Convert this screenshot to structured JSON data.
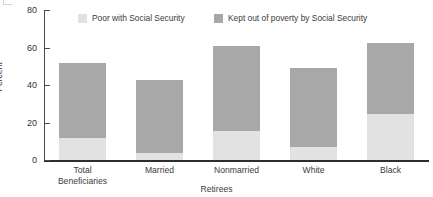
{
  "chart_data": {
    "type": "bar",
    "subtype": "stacked-bar",
    "title": "",
    "subtitle": "",
    "xlabel": "Retirees",
    "ylabel": "Percent",
    "categories": [
      "Total\nBeneficiaries",
      "Married",
      "Nonmarried",
      "White",
      "Black"
    ],
    "series": [
      {
        "name": "Poor with Social Security",
        "color": "#e2e2e2",
        "values": [
          11.5,
          3.7,
          15.5,
          7.0,
          24.5
        ]
      },
      {
        "name": "Kept out of poverty by Social Security",
        "color": "#a8a8a8",
        "values": [
          40.0,
          38.8,
          45.5,
          42.0,
          38.0
        ]
      }
    ],
    "totals": [
      51.5,
      42.5,
      61.0,
      49.0,
      62.5
    ],
    "ylim": [
      0,
      80
    ],
    "yticks": [
      0,
      20,
      40,
      60,
      80
    ],
    "ytick_labels": [
      "0",
      "20",
      "40",
      "60",
      "80"
    ],
    "grid": false,
    "legend_position": "top"
  },
  "legend": {
    "entries": [
      {
        "label": "Poor with Social Security",
        "color": "#e2e2e2"
      },
      {
        "label": "Kept out of poverty by Social Security",
        "color": "#a8a8a8"
      }
    ]
  },
  "axes": {
    "y_title": "Percent",
    "x_title": "Retirees",
    "y_ticks": [
      "80",
      "60",
      "40",
      "20",
      "0"
    ],
    "x_categories": [
      "Total\nBeneficiaries",
      "Married",
      "Nonmarried",
      "White",
      "Black"
    ]
  },
  "colors": {
    "series_light": "#e2e2e2",
    "series_dark": "#a8a8a8",
    "axis": "#2e2e2e",
    "text": "#3b3b3b",
    "background": "#ffffff"
  }
}
